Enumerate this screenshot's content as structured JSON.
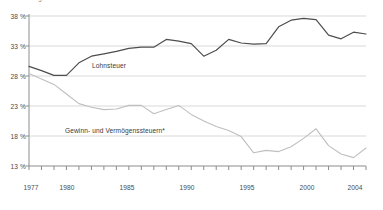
{
  "chart": {
    "title": "Anteil am gesamten Steueraufkommen in Prozent",
    "y_axis_labels": [
      "38 %",
      "33 %",
      "28 %",
      "23 %",
      "18 %",
      "13 %"
    ],
    "x_axis_labels": [
      "1977",
      "1980",
      "1985",
      "1990",
      "1995",
      "2000",
      "2004"
    ],
    "series_label_upper": "Lohnsteuer",
    "series_label_lower": "Gewinn- und Vermögenssteuern*",
    "color_upper": "#4d4d4d",
    "color_lower": "#bfbfbf",
    "color_grid": "#d9d9d9",
    "color_axis": "#8c8c8c"
  },
  "chart_data": {
    "type": "line",
    "title": "Anteil am gesamten Steueraufkommen in Prozent",
    "xlabel": "",
    "ylabel": "%",
    "ylim": [
      13,
      38
    ],
    "xlim": [
      1977,
      2004
    ],
    "grid": true,
    "yticks": [
      13,
      18,
      23,
      28,
      33,
      38
    ],
    "xticks": [
      1977,
      1978,
      1979,
      1980,
      1981,
      1982,
      1983,
      1984,
      1985,
      1986,
      1987,
      1988,
      1989,
      1990,
      1991,
      1992,
      1993,
      1994,
      1995,
      1996,
      1997,
      1998,
      1999,
      2000,
      2001,
      2002,
      2003,
      2004
    ],
    "xtick_labels_shown": [
      1977,
      1980,
      1985,
      1990,
      1995,
      2000,
      2004
    ],
    "legend": "inline-annotations",
    "x": [
      1977,
      1978,
      1979,
      1980,
      1981,
      1982,
      1983,
      1984,
      1985,
      1986,
      1987,
      1988,
      1989,
      1990,
      1991,
      1992,
      1993,
      1994,
      1995,
      1996,
      1997,
      1998,
      1999,
      2000,
      2001,
      2002,
      2003,
      2004
    ],
    "series": [
      {
        "name": "Lohnsteuer",
        "color": "#4d4d4d",
        "values": [
          29.6,
          28.9,
          28.1,
          28.1,
          30.2,
          31.3,
          31.7,
          32.1,
          32.6,
          32.8,
          32.8,
          34.1,
          33.8,
          33.4,
          31.3,
          32.3,
          34.1,
          33.5,
          33.3,
          33.4,
          36.2,
          37.3,
          37.6,
          37.4,
          34.8,
          34.2,
          35.3,
          35.0
        ]
      },
      {
        "name": "Gewinn- und Vermögenssteuern*",
        "color": "#bfbfbf",
        "values": [
          28.4,
          27.5,
          26.6,
          25.0,
          23.4,
          22.8,
          22.4,
          22.5,
          23.1,
          23.1,
          21.7,
          22.4,
          23.1,
          21.6,
          20.5,
          19.6,
          18.9,
          17.9,
          15.2,
          15.6,
          15.4,
          16.2,
          17.6,
          19.2,
          16.4,
          15.0,
          14.4,
          16.0
        ]
      }
    ],
    "annotations": [
      {
        "text": "Lohnsteuer",
        "x": 1983.5,
        "y": 31.0
      },
      {
        "text": "Gewinn- und Vermögenssteuern*",
        "x": 1983.0,
        "y": 20.5
      }
    ]
  }
}
